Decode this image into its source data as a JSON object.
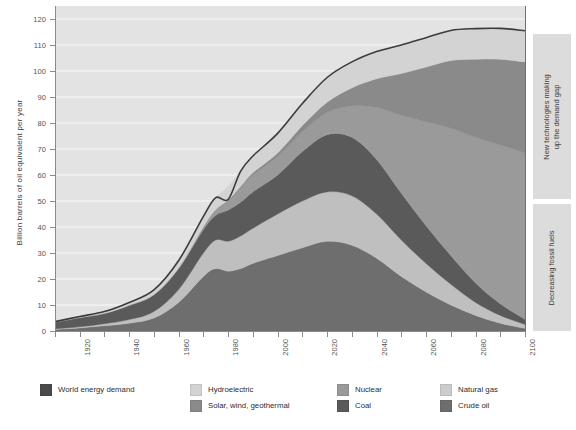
{
  "chart_data": {
    "type": "area",
    "title": "",
    "xlabel": "",
    "ylabel": "Billion barrels of oil equivalent per year",
    "xlim": [
      1910,
      2100
    ],
    "ylim": [
      0,
      125
    ],
    "ytick_step": 10,
    "grid": true,
    "legend_position": "bottom",
    "x": [
      1910,
      1920,
      1930,
      1940,
      1950,
      1960,
      1970,
      1975,
      1980,
      1985,
      1990,
      2000,
      2010,
      2020,
      2030,
      2040,
      2050,
      2060,
      2070,
      2080,
      2090,
      2100
    ],
    "series": [
      {
        "name": "Crude oil",
        "color": "#6e6e6e",
        "values": [
          0.6,
          1.2,
          2.0,
          3.0,
          5.0,
          11.0,
          21.0,
          24.0,
          23.0,
          24.0,
          26.0,
          29.0,
          32.0,
          34.5,
          33.0,
          28.0,
          21.0,
          15.0,
          10.0,
          6.0,
          3.0,
          1.0
        ]
      },
      {
        "name": "Natural gas",
        "color": "#bfbfbf",
        "values": [
          0.2,
          0.4,
          0.8,
          1.4,
          2.5,
          5.0,
          9.0,
          11.0,
          11.5,
          12.5,
          13.5,
          16.0,
          18.0,
          19.0,
          19.0,
          17.0,
          14.0,
          11.0,
          8.0,
          5.0,
          3.0,
          1.5
        ]
      },
      {
        "name": "Coal",
        "color": "#5a5a5a",
        "values": [
          2.6,
          3.6,
          4.0,
          5.5,
          6.5,
          8.0,
          9.0,
          9.5,
          12.0,
          13.0,
          14.0,
          15.0,
          19.0,
          22.0,
          22.5,
          21.0,
          18.0,
          14.5,
          11.0,
          7.5,
          4.5,
          2.0
        ]
      },
      {
        "name": "Nuclear",
        "color": "#9a9a9a",
        "values": [
          0.0,
          0.0,
          0.0,
          0.0,
          0.0,
          0.3,
          1.0,
          2.0,
          3.5,
          5.5,
          6.5,
          7.0,
          7.5,
          8.5,
          12.0,
          20.0,
          30.0,
          40.0,
          49.0,
          56.0,
          61.0,
          64.0
        ]
      },
      {
        "name": "Solar, wind, geothermal",
        "color": "#8a8a8a",
        "values": [
          0.0,
          0.0,
          0.0,
          0.0,
          0.0,
          0.0,
          0.1,
          0.2,
          0.4,
          0.6,
          0.9,
          1.5,
          2.5,
          4.0,
          7.0,
          11.0,
          16.0,
          21.0,
          26.0,
          30.0,
          33.0,
          35.0
        ]
      },
      {
        "name": "Hydroelectric",
        "color": "#d3d3d3",
        "values": [
          0.2,
          0.4,
          0.7,
          1.1,
          1.8,
          2.8,
          4.0,
          4.6,
          5.2,
          5.8,
          6.4,
          7.5,
          8.5,
          9.5,
          10.0,
          10.5,
          11.0,
          11.3,
          11.6,
          11.8,
          11.9,
          12.0
        ]
      }
    ],
    "demand_line": {
      "name": "World energy demand",
      "color": "#3c3c3c",
      "values": [
        3.6,
        5.6,
        7.5,
        11.0,
        15.8,
        27.1,
        44.1,
        51.3,
        50.6,
        61.4,
        67.3,
        76.0,
        87.5,
        97.5,
        103.5,
        107.5,
        110.0,
        112.8,
        115.6,
        116.3,
        116.4,
        115.5
      ]
    },
    "y_ticks": [
      0,
      10,
      20,
      30,
      40,
      50,
      60,
      70,
      80,
      90,
      100,
      110,
      120
    ],
    "x_ticks": [
      1920,
      1940,
      1960,
      1980,
      2000,
      2020,
      2040,
      2060,
      2080,
      2100
    ],
    "x_minor_ticks": [
      1910,
      1930,
      1950,
      1970,
      1990,
      2010,
      2030,
      2050,
      2070,
      2090
    ],
    "legend": [
      {
        "label": "World energy demand",
        "color": "#4a4a4a",
        "col": 0,
        "row": 0
      },
      {
        "label": "Hydroelectric",
        "color": "#d3d3d3",
        "col": 1,
        "row": 0
      },
      {
        "label": "Solar, wind, geothermal",
        "color": "#8a8a8a",
        "col": 1,
        "row": 1
      },
      {
        "label": "Nuclear",
        "color": "#9a9a9a",
        "col": 2,
        "row": 0
      },
      {
        "label": "Coal",
        "color": "#5a5a5a",
        "col": 2,
        "row": 1
      },
      {
        "label": "Natural gas",
        "color": "#cccccc",
        "col": 3,
        "row": 0
      },
      {
        "label": "Crude oil",
        "color": "#6e6e6e",
        "col": 3,
        "row": 1
      }
    ]
  },
  "annotations": [
    {
      "id": "new-tech",
      "text": "New technologies making\nup the demand gap"
    },
    {
      "id": "decreasing-foss",
      "text": "Decreasing fossil fuels"
    }
  ],
  "colors": {
    "plot_background": "#e3e3e3",
    "gridline": "#f2f2f2",
    "axis": "#8b8b8b",
    "annotation_background": "#dcdcdc",
    "page_background": "#ffffff"
  }
}
